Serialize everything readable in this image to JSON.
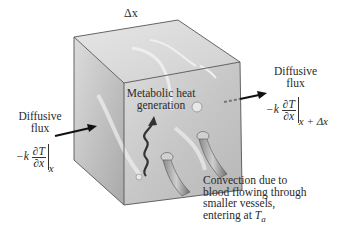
{
  "figure": {
    "dimension_label": "Δx",
    "center_label": {
      "line1": "Metabolic heat",
      "line2": "generation"
    },
    "left_flux": {
      "line1": "Diffusive",
      "line2": "flux",
      "coef": "−k",
      "num": "∂T",
      "den": "∂x",
      "eval_at": "x"
    },
    "right_flux": {
      "line1": "Diffusive",
      "line2": "flux",
      "coef": "−k",
      "num": "∂T",
      "den": "∂x",
      "eval_at": "x + Δx"
    },
    "convection_label": {
      "line1": "Convection due to",
      "line2": "blood flowing through",
      "line3": "smaller vessels,",
      "line4_prefix": "entering at ",
      "line4_var": "T",
      "line4_sub": "a"
    },
    "colors": {
      "cube_front": "#c9c9c9",
      "cube_top": "#dedede",
      "cube_side": "#b5b5b5",
      "edge": "#555555",
      "arrow": "#111111",
      "wave": "#3a3a3a"
    }
  }
}
